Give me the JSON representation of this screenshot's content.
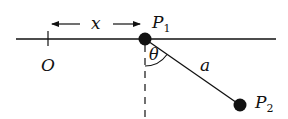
{
  "diagram": {
    "labels": {
      "origin": "O",
      "distance": "x",
      "p1_main": "P",
      "p1_sub": "1",
      "p2_main": "P",
      "p2_sub": "2",
      "angle": "θ",
      "length": "a"
    },
    "colors": {
      "ink": "#111111",
      "background": "#ffffff"
    }
  }
}
